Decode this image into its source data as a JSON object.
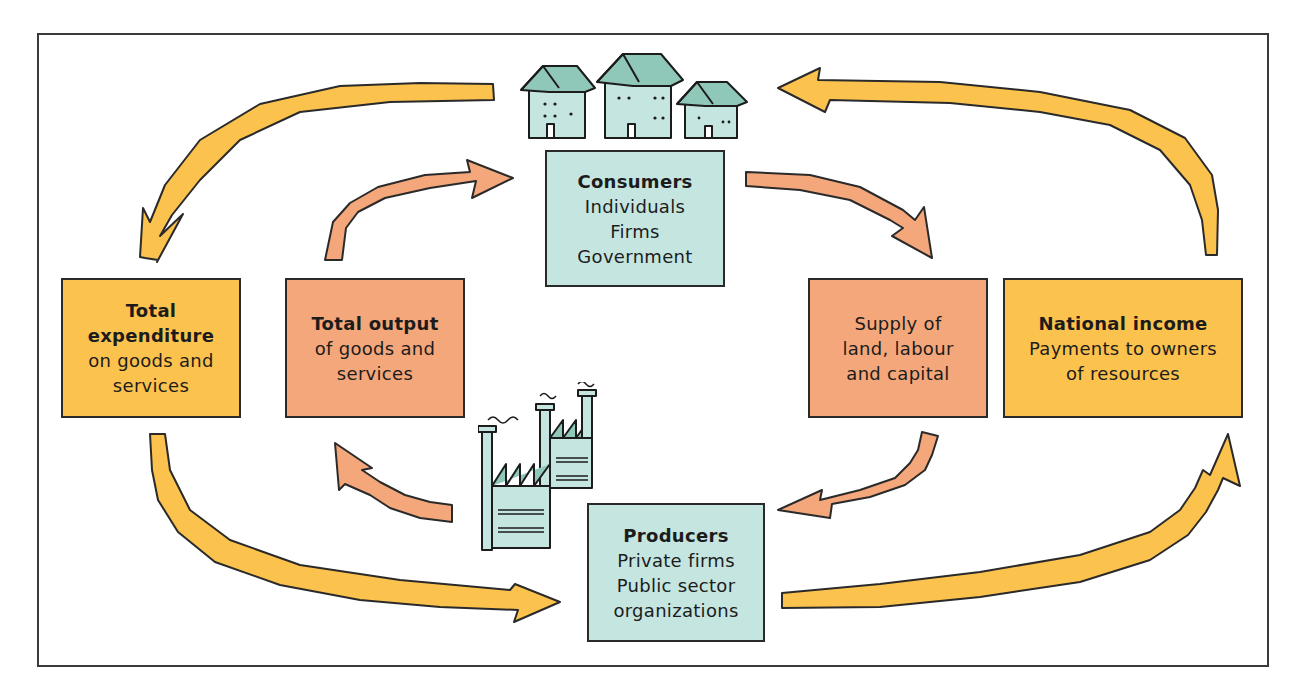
{
  "diagram": {
    "type": "circular-flow-of-income",
    "colors": {
      "money_flow": "#fcc24e",
      "real_flow": "#f4a77a",
      "agents": "#c5e5e0",
      "outline": "#2a2a2a"
    },
    "nodes": {
      "consumers": {
        "title": "Consumers",
        "lines": [
          "Individuals",
          "Firms",
          "Government"
        ],
        "illustration": "houses-icon"
      },
      "producers": {
        "title": "Producers",
        "lines": [
          "Private firms",
          "Public sector",
          "organizations"
        ],
        "illustration": "factory-icon"
      },
      "total_expenditure": {
        "title_lines": [
          "Total",
          "expenditure"
        ],
        "lines": [
          "on goods and",
          "services"
        ]
      },
      "total_output": {
        "title": "Total output",
        "lines": [
          "of goods and",
          "services"
        ]
      },
      "supply": {
        "lines": [
          "Supply of",
          "land, labour",
          "and capital"
        ]
      },
      "national_income": {
        "title": "National income",
        "lines": [
          "Payments to owners",
          "of resources"
        ]
      }
    },
    "flows": [
      {
        "from": "consumers",
        "to": "total_expenditure",
        "color": "money_flow"
      },
      {
        "from": "total_expenditure",
        "to": "producers",
        "color": "money_flow"
      },
      {
        "from": "producers",
        "to": "national_income",
        "color": "money_flow"
      },
      {
        "from": "national_income",
        "to": "consumers",
        "color": "money_flow"
      },
      {
        "from": "consumers",
        "to": "supply",
        "color": "real_flow"
      },
      {
        "from": "supply",
        "to": "producers",
        "color": "real_flow"
      },
      {
        "from": "producers",
        "to": "total_output",
        "color": "real_flow"
      },
      {
        "from": "total_output",
        "to": "consumers",
        "color": "real_flow"
      }
    ]
  }
}
